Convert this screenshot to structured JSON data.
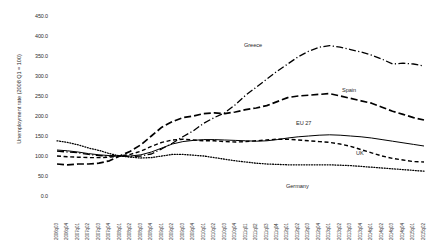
{
  "chart_data": {
    "type": "line",
    "title": "",
    "xlabel": "",
    "ylabel": "Unemployment rate (2008 Q1 = 100)",
    "ylim": [
      0,
      450
    ],
    "yticks": [
      "0.0",
      "50.0",
      "100.0",
      "150.0",
      "200.0",
      "250.0",
      "300.0",
      "350.0",
      "400.0",
      "450.0"
    ],
    "grid": false,
    "legend_position": "inline-annotations",
    "categories": [
      "2006q03",
      "2006q04",
      "2007q01",
      "2007q02",
      "2007q03",
      "2007q04",
      "2008q01",
      "2008q02",
      "2008q03",
      "2008q04",
      "2009q01",
      "2009q02",
      "2009q03",
      "2009q04",
      "2010q01",
      "2010q02",
      "2010q03",
      "2010q04",
      "2011q01",
      "2011q02",
      "2011q03",
      "2011q04",
      "2012q01",
      "2012q02",
      "2012q03",
      "2012q04",
      "2013q01",
      "2013q02",
      "2013q03",
      "2013q04",
      "2014q01",
      "2014q02",
      "2014q03",
      "2014q04",
      "2015q01",
      "2015q02"
    ],
    "series": [
      {
        "name": "Greece",
        "style": "dash-dot",
        "values": [
          112,
          110,
          108,
          104,
          101,
          100,
          100,
          99,
          100,
          105,
          118,
          132,
          148,
          163,
          182,
          196,
          208,
          228,
          252,
          272,
          292,
          312,
          330,
          348,
          362,
          372,
          376,
          372,
          366,
          360,
          352,
          342,
          330,
          332,
          330,
          325
        ]
      },
      {
        "name": "Spain",
        "style": "long-dash",
        "values": [
          80,
          78,
          80,
          80,
          82,
          88,
          100,
          112,
          128,
          150,
          172,
          186,
          196,
          200,
          206,
          208,
          206,
          210,
          216,
          220,
          226,
          236,
          246,
          250,
          252,
          254,
          256,
          250,
          244,
          238,
          232,
          222,
          212,
          204,
          196,
          190
        ]
      },
      {
        "name": "EU 27",
        "style": "solid",
        "values": [
          115,
          113,
          110,
          106,
          103,
          101,
          100,
          100,
          103,
          110,
          120,
          130,
          136,
          139,
          141,
          141,
          140,
          139,
          138,
          137,
          138,
          141,
          145,
          148,
          150,
          152,
          153,
          152,
          150,
          148,
          145,
          141,
          137,
          133,
          129,
          125
        ]
      },
      {
        "name": "UK",
        "style": "dash",
        "values": [
          100,
          98,
          97,
          96,
          96,
          97,
          100,
          104,
          112,
          124,
          134,
          140,
          142,
          140,
          138,
          138,
          136,
          135,
          136,
          138,
          140,
          142,
          142,
          140,
          138,
          136,
          134,
          130,
          124,
          116,
          108,
          100,
          94,
          90,
          86,
          85
        ]
      },
      {
        "name": "Germany",
        "style": "dotted",
        "values": [
          138,
          134,
          128,
          120,
          114,
          106,
          100,
          97,
          95,
          96,
          100,
          104,
          104,
          102,
          100,
          96,
          92,
          88,
          85,
          82,
          80,
          79,
          78,
          78,
          78,
          78,
          78,
          77,
          76,
          74,
          72,
          70,
          68,
          66,
          64,
          62
        ]
      }
    ],
    "annotations": [
      {
        "text": "Greece",
        "x": 244,
        "y": 42
      },
      {
        "text": "Spain",
        "x": 342,
        "y": 87
      },
      {
        "text": "EU 27",
        "x": 296,
        "y": 120
      },
      {
        "text": "UK",
        "x": 356,
        "y": 150
      },
      {
        "text": "Germany",
        "x": 286,
        "y": 183
      }
    ]
  }
}
